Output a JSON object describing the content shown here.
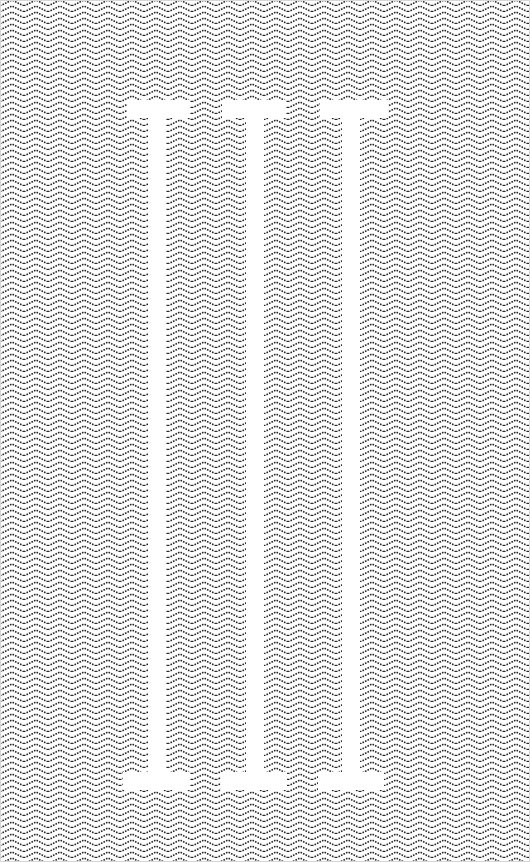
{
  "artwork": {
    "numeral_text": "III",
    "background_pattern": "herringbone-chevron",
    "colors": {
      "pattern_ink": "#2a2a2a",
      "background": "#ffffff",
      "numeral_fill": "#ffffff"
    },
    "pillars": [
      {
        "name": "left",
        "stem_x": 148,
        "stem_w": 18,
        "top_serif": [
          127,
          190
        ],
        "bottom_serif": [
          123,
          190
        ]
      },
      {
        "name": "middle",
        "stem_x": 246,
        "stem_w": 18,
        "top_serif": [
          222,
          286
        ],
        "bottom_serif": [
          221,
          287
        ]
      },
      {
        "name": "right",
        "stem_x": 342,
        "stem_w": 18,
        "top_serif": [
          320,
          388
        ],
        "bottom_serif": [
          318,
          384
        ]
      }
    ]
  }
}
